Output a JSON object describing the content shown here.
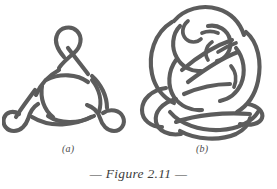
{
  "figure": {
    "caption": "— Figure 2.11 —",
    "caption_color": "#3d3d3d",
    "background_color": "#ffffff",
    "stroke_color": "#5c5c5c",
    "panels": [
      {
        "id": "a",
        "label": "(a)",
        "name": "trefoil-knot-diagram",
        "description": "Trefoil-style knot projection with three small outer loops (top, lower-left, lower-right) and a triangular interwoven center"
      },
      {
        "id": "b",
        "label": "(b)",
        "name": "complex-knot-diagram",
        "description": "Complex multi-crossing knot projection with large sweeping outer arcs and a dense interwoven core"
      }
    ]
  },
  "labels": {
    "panel_a": "(a)",
    "panel_b": "(b)"
  }
}
